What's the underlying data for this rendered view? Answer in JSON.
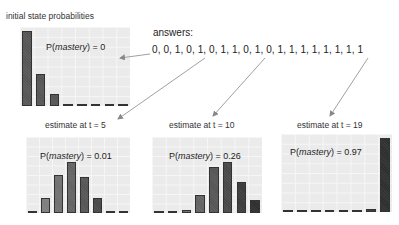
{
  "answers": {
    "label": "answers:",
    "sequence": "0, 0, 1, 0, 1, 0, 1, 1, 0, 1, 0, 1, 1, 1, 1, 1, 1, 1, 1"
  },
  "colors": {
    "panel_bg": "#ebebeb",
    "grid": "#f6f6f6",
    "bar_light": "#8a8a8a",
    "bar_dark": "#2e2e2e",
    "arrow": "#888888"
  },
  "chart_data": [
    {
      "type": "bar",
      "title": "initial state probabilities",
      "annotation": "P(mastery) = 0",
      "annotation_prefix": "P(",
      "annotation_var": "mastery",
      "annotation_suffix": ") = 0",
      "categories": [
        "0",
        "1",
        "2",
        "3",
        "4",
        "5",
        "6",
        "7"
      ],
      "values": [
        0.63,
        0.27,
        0.1,
        0.0,
        0.0,
        0.0,
        0.0,
        0.0
      ],
      "ylim": [
        0,
        0.65
      ],
      "grid": true
    },
    {
      "type": "bar",
      "title": "estimate at t = 5",
      "annotation": "P(mastery) = 0.01",
      "annotation_prefix": "P(",
      "annotation_var": "mastery",
      "annotation_suffix": ") = 0.01",
      "categories": [
        "0",
        "1",
        "2",
        "3",
        "4",
        "5",
        "6",
        "7"
      ],
      "values": [
        0.01,
        0.09,
        0.23,
        0.31,
        0.22,
        0.09,
        0.01,
        0.0
      ],
      "ylim": [
        0,
        0.45
      ],
      "grid": true
    },
    {
      "type": "bar",
      "title": "estimate at t = 10",
      "annotation": "P(mastery) = 0.26",
      "annotation_prefix": "P(",
      "annotation_var": "mastery",
      "annotation_suffix": ") = 0.26",
      "categories": [
        "0",
        "1",
        "2",
        "3",
        "4",
        "5",
        "6",
        "7"
      ],
      "values": [
        0.005,
        0.01,
        0.02,
        0.11,
        0.28,
        0.31,
        0.19,
        0.08
      ],
      "ylim": [
        0,
        0.45
      ],
      "grid": true
    },
    {
      "type": "bar",
      "title": "estimate at t = 19",
      "annotation": "P(mastery) = 0.97",
      "annotation_prefix": "P(",
      "annotation_var": "mastery",
      "annotation_suffix": ") = 0.97",
      "categories": [
        "0",
        "1",
        "2",
        "3",
        "4",
        "5",
        "6",
        "7"
      ],
      "values": [
        0.0,
        0.0,
        0.0,
        0.0,
        0.0,
        0.01,
        0.04,
        0.88
      ],
      "ylim": [
        0,
        0.9
      ],
      "grid": true
    }
  ]
}
